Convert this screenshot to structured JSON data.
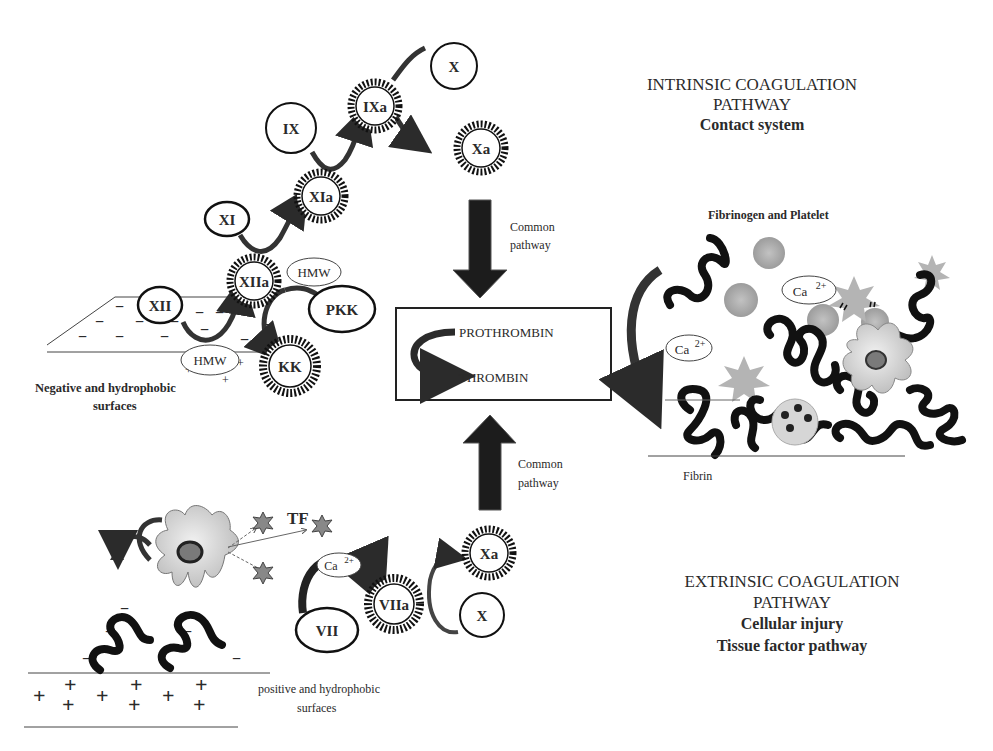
{
  "titles": {
    "intrinsic": {
      "line1": "INTRINSIC COAGULATION",
      "line2": "PATHWAY",
      "line3": "Contact system"
    },
    "extrinsic": {
      "line1": "EXTRINSIC COAGULATION",
      "line2": "PATHWAY",
      "line3": "Cellular injury",
      "line4": "Tissue factor pathway"
    }
  },
  "common_pathway": {
    "top": {
      "line1": "Common",
      "line2": "pathway"
    },
    "bottom": {
      "line1": "Common",
      "line2": "pathway"
    }
  },
  "central_box": {
    "from": "PROTHROMBIN",
    "to": "THROMBIN"
  },
  "intrinsic_nodes": {
    "X": "X",
    "IXa": "IXa",
    "Xa": "Xa",
    "IX": "IX",
    "XIa": "XIa",
    "XI": "XI",
    "XIIa": "XIIa",
    "XII": "XII",
    "HMW_top": "HMW",
    "PKK": "PKK",
    "KK": "KK",
    "HMW_bottom": "HMW"
  },
  "intrinsic_surface": {
    "line1": "Negative and hydrophobic",
    "line2": "surfaces",
    "charge": "−",
    "plus": "+"
  },
  "extrinsic_nodes": {
    "TF": "TF",
    "Ca": "Ca",
    "Ca_sup": "2+",
    "VII": "VII",
    "VIIa": "VIIa",
    "Xa": "Xa",
    "X": "X"
  },
  "extrinsic_surface": {
    "line1": "positive and hydrophobic",
    "line2": "surfaces",
    "plus": "+",
    "minus": "−"
  },
  "clot": {
    "title": "Fibrinogen and Platelet",
    "ca1": "Ca",
    "ca2": "Ca",
    "sup": "2+",
    "fibrin": "Fibrin"
  },
  "colors": {
    "ink": "#1a1a1a",
    "arrow": "#2b2b2b",
    "gray_platelet": "#a8a8a8",
    "cell": "#d8d8d8",
    "nucleus": "#7a7a7a"
  }
}
